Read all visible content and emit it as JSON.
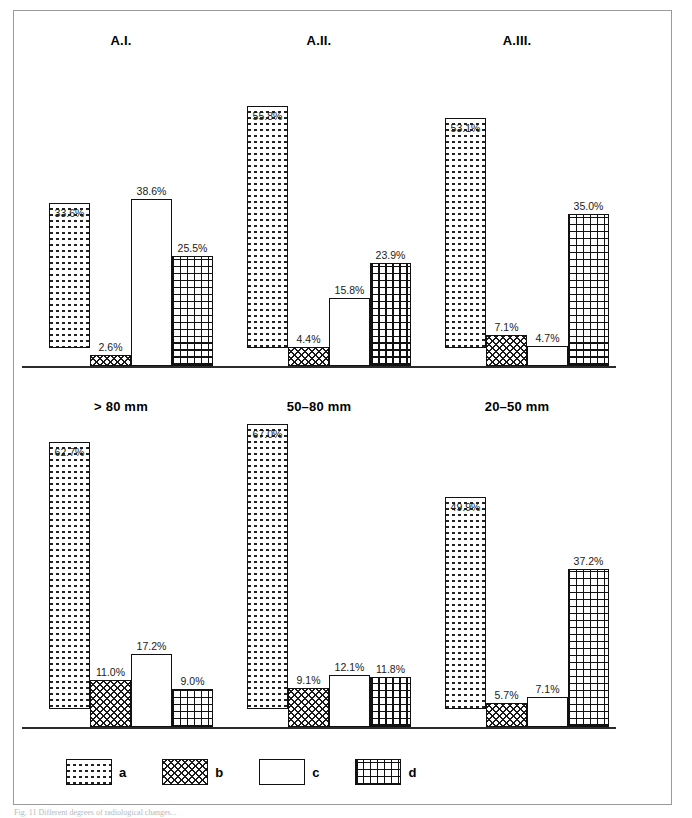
{
  "figure": {
    "caption": "Fig. 11  Different degrees of radiological changes...",
    "legend": {
      "items": [
        {
          "key": "a",
          "label": "a",
          "pattern": "dashed-rows"
        },
        {
          "key": "b",
          "label": "b",
          "pattern": "diagonal-crosshatch"
        },
        {
          "key": "c",
          "label": "c",
          "pattern": "plain-white"
        },
        {
          "key": "d",
          "label": "d",
          "pattern": "orthogonal-grid"
        }
      ]
    }
  },
  "chart_data": {
    "type": "bar",
    "title": "",
    "xlabel": "",
    "ylabel": "",
    "ylim": [
      0,
      70
    ],
    "grid": false,
    "legend_position": "bottom",
    "categories": [
      "a",
      "b",
      "c",
      "d"
    ],
    "panels": [
      {
        "id": "a1",
        "title": "A.I.",
        "row": "top",
        "values": [
          33.6,
          2.6,
          38.6,
          25.5
        ],
        "labels": [
          "33.6%",
          "2.6%",
          "38.6%",
          "25.5%"
        ]
      },
      {
        "id": "a2",
        "title": "A.II.",
        "row": "top",
        "values": [
          55.8,
          4.4,
          15.8,
          23.9
        ],
        "labels": [
          "55.8%",
          "4.4%",
          "15.8%",
          "23.9%"
        ]
      },
      {
        "id": "a3",
        "title": "A.III.",
        "row": "top",
        "values": [
          53.1,
          7.1,
          4.7,
          35.0
        ],
        "labels": [
          "53.1%",
          "7.1%",
          "4.7%",
          "35.0%"
        ]
      },
      {
        "id": "s1",
        "title": "> 80 mm",
        "row": "bottom",
        "values": [
          62.7,
          11.0,
          17.2,
          9.0
        ],
        "labels": [
          "62.7%",
          "11.0%",
          "17.2%",
          "9.0%"
        ]
      },
      {
        "id": "s2",
        "title": "50–80 mm",
        "row": "bottom",
        "values": [
          67.0,
          9.1,
          12.1,
          11.8
        ],
        "labels": [
          "67.0%",
          "9.1%",
          "12.1%",
          "11.8%"
        ]
      },
      {
        "id": "s3",
        "title": "20–50 mm",
        "row": "bottom",
        "values": [
          49.9,
          5.7,
          7.1,
          37.2
        ],
        "labels": [
          "49.9%",
          "5.7%",
          "7.1%",
          "37.2%"
        ]
      }
    ]
  },
  "colors": {
    "frame": "#9a9a9a",
    "baseline": "#2b2b2b",
    "bar_outline": "#111111",
    "label_text": "#1a1a1a",
    "title_text": "#000000"
  }
}
